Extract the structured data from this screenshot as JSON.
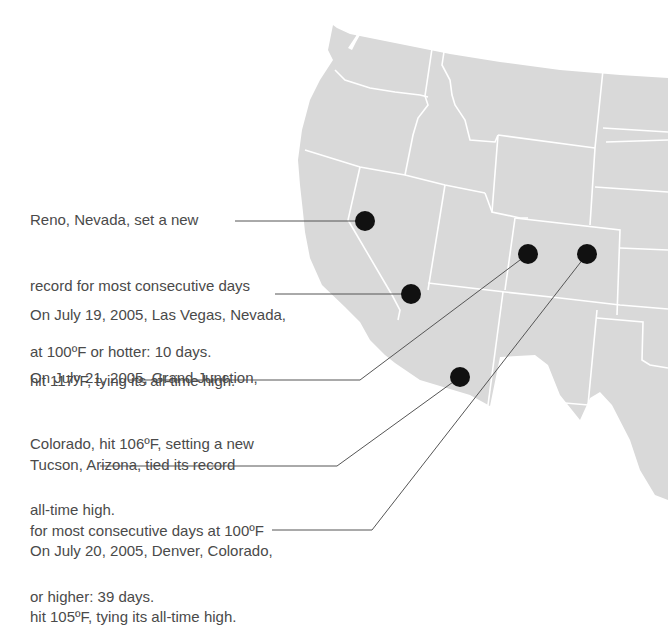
{
  "colors": {
    "land": "#d9d9d9",
    "borders": "#ffffff",
    "dot": "#111111",
    "leader": "#555555",
    "text": "#4a4a4a",
    "background": "#ffffff"
  },
  "annotations": [
    {
      "city": "Reno, Nevada",
      "lines": [
        "Reno, Nevada, set a new",
        "record for most consecutive days",
        "at 100ºF or hotter: 10 days."
      ]
    },
    {
      "city": "Las Vegas, Nevada",
      "lines": [
        "On July 19, 2005, Las Vegas, Nevada,",
        "hit 117ºF, tying its all-time high."
      ]
    },
    {
      "city": "Grand Junction, Colorado",
      "lines": [
        "On July 21, 2005, Grand Junction,",
        "Colorado, hit 106ºF, setting a new",
        "all-time high."
      ]
    },
    {
      "city": "Tucson, Arizona",
      "lines": [
        "Tucson, Arizona, tied its record",
        "for most consecutive days at 100ºF",
        "or higher: 39 days."
      ]
    },
    {
      "city": "Denver, Colorado",
      "lines": [
        "On July 20, 2005, Denver, Colorado,",
        "hit 105ºF, tying its all-time high."
      ]
    }
  ],
  "markers": [
    {
      "city": "Reno",
      "x": 365,
      "y": 221
    },
    {
      "city": "Las Vegas",
      "x": 411,
      "y": 294
    },
    {
      "city": "Grand Junction",
      "x": 528,
      "y": 254
    },
    {
      "city": "Denver",
      "x": 587,
      "y": 254
    },
    {
      "city": "Tucson",
      "x": 460,
      "y": 377
    }
  ]
}
